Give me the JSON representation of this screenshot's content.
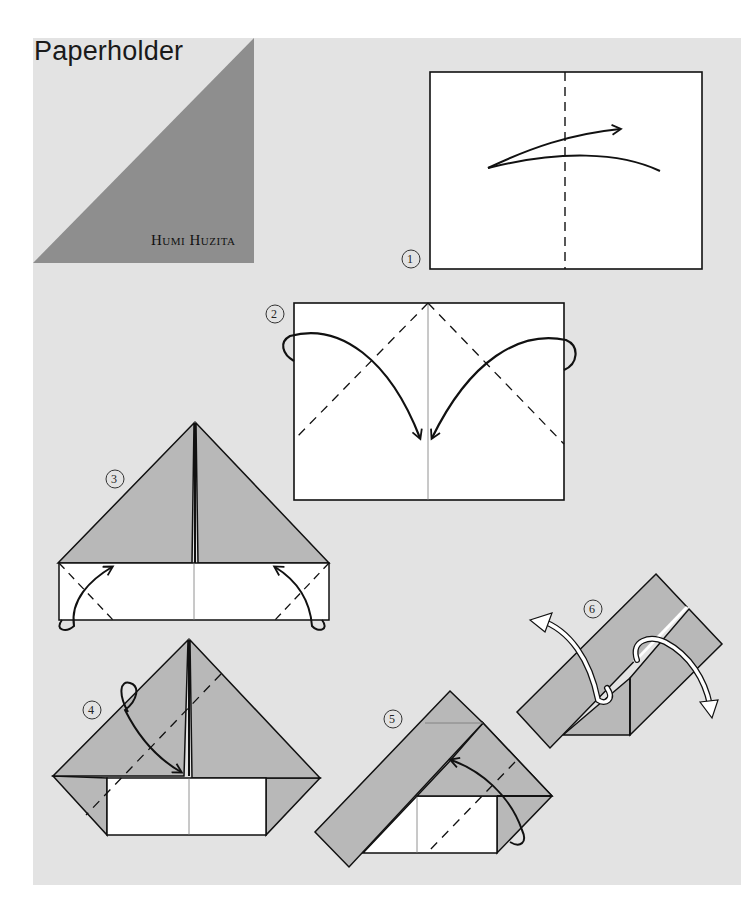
{
  "title": "Paperholder",
  "author": "Humi Huzita",
  "colors": {
    "page_background": "#e3e3e3",
    "corner_triangle": "#8e8e8e",
    "paper_colored_side": "#b8b8b8",
    "paper_white_side": "#ffffff",
    "line": "#111111"
  },
  "steps": [
    {
      "number": "1",
      "description": "Rectangle with vertical dashed valley fold in center; arrow shows folding in half and unfolding"
    },
    {
      "number": "2",
      "description": "Fold top corners down to center crease along dashed lines"
    },
    {
      "number": "3",
      "description": "Triangle on top of white strip; fold bottom corners up along dashed lines"
    },
    {
      "number": "4",
      "description": "Fold top flap down along dashed diagonal line"
    },
    {
      "number": "5",
      "description": "Diagonal strip across; fold lower right corner up along dashed line"
    },
    {
      "number": "6",
      "description": "Two parallel strips; pull open along arrows"
    }
  ]
}
